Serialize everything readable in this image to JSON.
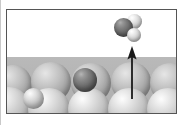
{
  "figure": {
    "kind": "scientific-illustration",
    "caption": "",
    "panel": {
      "border_color": "#555555",
      "background_color": "#ffffff",
      "x": 6,
      "y": 9,
      "width": 171,
      "height": 105
    }
  },
  "colors": {
    "substrate_light": "#c3c3c3",
    "substrate_back": "#a6a6a6",
    "marked_atom_dark": "#5a5a5a",
    "molecule_center_dark": "#585858",
    "molecule_outer_light": "#e2e2e2",
    "arrow": "#1a1a1a",
    "frame": "#555555",
    "slab": "#b3b3b3"
  },
  "annotations": {
    "arrow": {
      "name": "desorption-arrow",
      "direction": "up",
      "label": "",
      "tail_y": 90,
      "head_y": 36
    }
  },
  "molecule": {
    "name": "adsorbate-molecule",
    "atom_count": 3,
    "atoms": [
      {
        "id": "center",
        "role": "heavy-atom",
        "shade": "dark",
        "cx": 123,
        "cy": 27,
        "r": 9.5
      },
      {
        "id": "upper",
        "role": "light-atom",
        "shade": "light",
        "cx": 134,
        "cy": 20,
        "r": 7.5
      },
      {
        "id": "lower",
        "role": "light-atom",
        "shade": "light",
        "cx": 133,
        "cy": 34,
        "r": 7.0
      }
    ]
  },
  "surface": {
    "name": "metal-surface",
    "rows": [
      {
        "id": "back-row",
        "shade": "back",
        "atoms": [
          {
            "cx": 6,
            "cy": 74,
            "r": 19
          },
          {
            "cx": 44,
            "cy": 72,
            "r": 20
          },
          {
            "cx": 84,
            "cy": 73,
            "r": 20
          },
          {
            "cx": 124,
            "cy": 72,
            "r": 20
          },
          {
            "cx": 163,
            "cy": 73,
            "r": 20
          }
        ]
      },
      {
        "id": "front-row",
        "shade": "light",
        "atoms": [
          {
            "cx": 2,
            "cy": 98,
            "r": 21
          },
          {
            "cx": 42,
            "cy": 99,
            "r": 21
          },
          {
            "cx": 82,
            "cy": 99,
            "r": 21
          },
          {
            "cx": 122,
            "cy": 99,
            "r": 21
          },
          {
            "cx": 161,
            "cy": 99,
            "r": 21
          }
        ]
      }
    ],
    "special_atoms": [
      {
        "id": "small-interstitial",
        "shade": "light",
        "cx": 27,
        "cy": 89,
        "r": 10.5
      },
      {
        "id": "marked-dark-atom",
        "shade": "dark",
        "cx": 78,
        "cy": 80,
        "r": 12.0
      }
    ]
  }
}
